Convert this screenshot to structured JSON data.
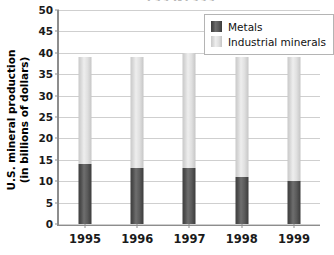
{
  "chart_data": {
    "type": "bar",
    "subtype": "stacked-bar",
    "title": "1995-1999",
    "xlabel": "",
    "ylabel": "U.S. mineral production (in billions of dollars)",
    "ylabel_lines": [
      "U.S. mineral production",
      "(in billions of dollars)"
    ],
    "categories": [
      "1995",
      "1996",
      "1997",
      "1998",
      "1999"
    ],
    "series": [
      {
        "name": "Metals",
        "color": "#4d4d4d",
        "values": [
          14,
          13,
          13,
          11,
          10
        ]
      },
      {
        "name": "Industrial minerals",
        "color": "#d7d7d7",
        "values": [
          25,
          26,
          27,
          28,
          29
        ]
      }
    ],
    "totals": [
      39,
      39,
      40,
      39,
      39
    ],
    "ylim": [
      0,
      50
    ],
    "ytick_step": 5,
    "yticks": [
      "50",
      "45",
      "40",
      "35",
      "30",
      "25",
      "20",
      "15",
      "10",
      "5",
      "0"
    ],
    "grid": true,
    "grid_axis": "y",
    "legend_position": "top-right",
    "legend": [
      "Metals",
      "Industrial minerals"
    ]
  },
  "axes": {
    "line_color": "#8d8d8d",
    "grid_color": "#cfcfcf"
  }
}
